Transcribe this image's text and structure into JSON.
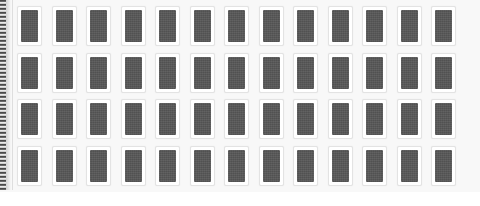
{
  "page": {
    "background_color": "#f8f8f8",
    "footer_background_color": "#ffffff"
  },
  "binding": {
    "name": "spiral-binding-edge",
    "dark_color": "#3a3a3a",
    "light_color": "#e8e8e8",
    "width_px": 6,
    "height_px": 190
  },
  "grid": {
    "rows": 4,
    "columns": 13,
    "total_cards": 52,
    "card": {
      "width_px": 25,
      "height_px": 40,
      "frame_color": "#ffffff",
      "border_color": "#e3e3e3",
      "thumb_color": "#565656"
    },
    "row_labels": [
      "row-1",
      "row-2",
      "row-3",
      "row-4"
    ]
  },
  "chart_data": {
    "type": "heatmap",
    "title": "",
    "xlabel": "",
    "ylabel": "",
    "categories": [
      "1",
      "2",
      "3",
      "4",
      "5",
      "6",
      "7",
      "8",
      "9",
      "10",
      "11",
      "12",
      "13"
    ],
    "rows": [
      "row-1",
      "row-2",
      "row-3",
      "row-4"
    ],
    "series": [
      {
        "name": "row-1",
        "values": [
          1,
          1,
          1,
          1,
          1,
          1,
          1,
          1,
          1,
          1,
          1,
          1,
          1
        ]
      },
      {
        "name": "row-2",
        "values": [
          1,
          1,
          1,
          1,
          1,
          1,
          1,
          1,
          1,
          1,
          1,
          1,
          1
        ]
      },
      {
        "name": "row-3",
        "values": [
          1,
          1,
          1,
          1,
          1,
          1,
          1,
          1,
          1,
          1,
          1,
          1,
          1
        ]
      },
      {
        "name": "row-4",
        "values": [
          1,
          1,
          1,
          1,
          1,
          1,
          1,
          1,
          1,
          1,
          1,
          1,
          1
        ]
      }
    ],
    "legend": [],
    "grid": false
  }
}
